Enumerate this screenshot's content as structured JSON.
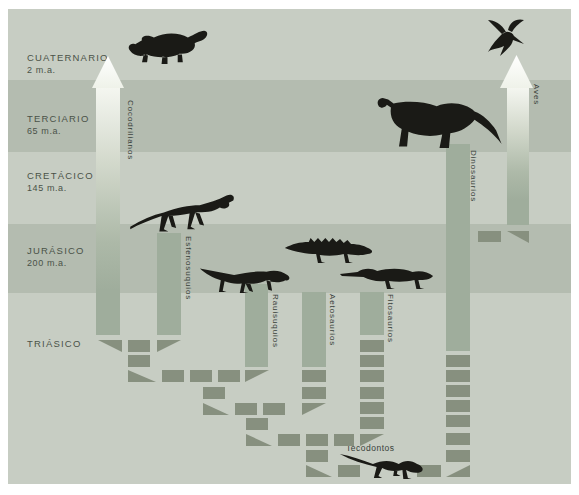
{
  "diagram": {
    "colors": {
      "band_light": "#c7cdc3",
      "band_dark": "#b4bcb0",
      "bar": "#9fad9c",
      "dash": "#87907f",
      "text": "#4a5248",
      "label": "#39413a",
      "legend_bg": "#f4f6f0",
      "animal": "#1a1a16"
    },
    "bands": [
      {
        "name": "CUATERNARIO",
        "age": "2 m.a.",
        "y": 0,
        "h": 71,
        "shade": "light",
        "label_y": 43
      },
      {
        "name": "TERCIARIO",
        "age": "65 m.a.",
        "y": 71,
        "h": 72,
        "shade": "dark",
        "label_y": 104
      },
      {
        "name": "CRETÁCICO",
        "age": "145 m.a.",
        "y": 143,
        "h": 72,
        "shade": "light",
        "label_y": 161
      },
      {
        "name": "JURÁSICO",
        "age": "200 m.a.",
        "y": 215,
        "h": 69,
        "shade": "dark",
        "label_y": 236
      },
      {
        "name": "TRIÁSICO",
        "age": "",
        "y": 284,
        "h": 191,
        "shade": "light",
        "label_y": 329
      }
    ],
    "groups": [
      {
        "label": "Cocodrilianos",
        "kind": "arrow",
        "bar": [
          88,
          79,
          24,
          247
        ],
        "head": [
          84,
          47,
          32,
          32
        ],
        "label_pos": [
          118,
          91
        ]
      },
      {
        "label": "Aves",
        "kind": "arrow",
        "bar": [
          499,
          79,
          22,
          137
        ],
        "head": [
          492,
          46,
          33,
          33
        ],
        "label_pos": [
          524,
          75
        ]
      },
      {
        "label": "Dinosaurios",
        "kind": "bar",
        "bar": [
          438,
          135,
          24,
          207
        ],
        "label_pos": [
          461,
          141
        ]
      },
      {
        "label": "Esfenosuquios",
        "kind": "bar",
        "bar": [
          149,
          224,
          24,
          102
        ],
        "label_pos": [
          176,
          227
        ]
      },
      {
        "label": "Rauisuquios",
        "kind": "bar",
        "bar": [
          237,
          275,
          23,
          83
        ],
        "label_pos": [
          263,
          285
        ]
      },
      {
        "label": "Aetosaurios",
        "kind": "bar",
        "bar": [
          294,
          283,
          24,
          75
        ],
        "label_pos": [
          320,
          285
        ]
      },
      {
        "label": "Fitosaurios",
        "kind": "bar",
        "bar": [
          352,
          283,
          24,
          43
        ],
        "label_pos": [
          378,
          285
        ]
      },
      {
        "label": "Tecodontos",
        "kind": "text",
        "label_pos": [
          338,
          434
        ]
      }
    ],
    "relations": {
      "dashes": [
        [
          120,
          331,
          22,
          12
        ],
        [
          120,
          346,
          22,
          12
        ],
        [
          154,
          361,
          22,
          12
        ],
        [
          182,
          361,
          22,
          12
        ],
        [
          210,
          361,
          22,
          12
        ],
        [
          195,
          378,
          22,
          12
        ],
        [
          227,
          394,
          22,
          12
        ],
        [
          255,
          394,
          22,
          12
        ],
        [
          294,
          361,
          24,
          12
        ],
        [
          294,
          378,
          24,
          12
        ],
        [
          238,
          409,
          22,
          12
        ],
        [
          270,
          425,
          22,
          12
        ],
        [
          298,
          425,
          22,
          12
        ],
        [
          326,
          425,
          20,
          12
        ],
        [
          352,
          331,
          24,
          12
        ],
        [
          352,
          346,
          24,
          12
        ],
        [
          352,
          361,
          24,
          12
        ],
        [
          352,
          378,
          24,
          12
        ],
        [
          352,
          393,
          24,
          12
        ],
        [
          352,
          408,
          24,
          12
        ],
        [
          298,
          441,
          22,
          12
        ],
        [
          330,
          456,
          22,
          12
        ],
        [
          409,
          456,
          24,
          12
        ],
        [
          438,
          346,
          24,
          12
        ],
        [
          438,
          361,
          24,
          12
        ],
        [
          438,
          376,
          24,
          12
        ],
        [
          438,
          391,
          24,
          12
        ],
        [
          438,
          406,
          24,
          12
        ],
        [
          438,
          424,
          24,
          12
        ],
        [
          438,
          441,
          24,
          12
        ],
        [
          470,
          222,
          23,
          11
        ]
      ],
      "triangles": [
        [
          90,
          331,
          24,
          12,
          "br"
        ],
        [
          149,
          331,
          24,
          12,
          "bl"
        ],
        [
          120,
          361,
          28,
          12,
          "dr"
        ],
        [
          237,
          361,
          24,
          12,
          "bl"
        ],
        [
          195,
          394,
          26,
          12,
          "dr"
        ],
        [
          294,
          394,
          24,
          12,
          "bl"
        ],
        [
          238,
          425,
          26,
          12,
          "dr"
        ],
        [
          352,
          425,
          24,
          12,
          "bl"
        ],
        [
          298,
          456,
          26,
          12,
          "dr"
        ],
        [
          438,
          456,
          24,
          12,
          "dl"
        ],
        [
          499,
          222,
          22,
          12,
          "br"
        ]
      ]
    },
    "legend": {
      "x": 20,
      "y": 385,
      "w": 124,
      "h": 64,
      "extension_lines": [
        "Extensión",
        "del grupo",
        "en el tiempo"
      ],
      "relations_lines": [
        "Posibles",
        "relaciones"
      ]
    },
    "animals": [
      {
        "name": "crocodile-illustration",
        "key": "croc",
        "x": 117,
        "y": 19,
        "w": 85,
        "h": 38
      },
      {
        "name": "hummingbird-illustration",
        "key": "bird",
        "x": 478,
        "y": 9,
        "w": 40,
        "h": 44
      },
      {
        "name": "sauropod-illustration",
        "key": "sauropod",
        "x": 364,
        "y": 81,
        "w": 135,
        "h": 62
      },
      {
        "name": "sphenosuchian-illustration",
        "key": "spheno",
        "x": 120,
        "y": 177,
        "w": 112,
        "h": 48
      },
      {
        "name": "rauisuchian-illustration",
        "key": "raui",
        "x": 190,
        "y": 249,
        "w": 95,
        "h": 36
      },
      {
        "name": "aetosaur-illustration",
        "key": "aeto",
        "x": 275,
        "y": 225,
        "w": 92,
        "h": 32
      },
      {
        "name": "phytosaur-illustration",
        "key": "phyto",
        "x": 330,
        "y": 253,
        "w": 98,
        "h": 30
      },
      {
        "name": "tecodont-illustration",
        "key": "teco",
        "x": 330,
        "y": 437,
        "w": 92,
        "h": 36
      }
    ]
  }
}
